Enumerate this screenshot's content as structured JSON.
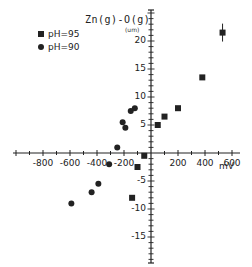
{
  "page": {
    "top_fragment": "on the left and on the decreased"
  },
  "chart_data": {
    "type": "scatter",
    "title": "Zn(g)-O(g)",
    "xlabel": "mV",
    "ylabel": "(um)",
    "xlim": [
      -1000,
      650
    ],
    "ylim": [
      -20,
      23
    ],
    "x_ticks": [
      -800,
      -600,
      -400,
      -200,
      200,
      400,
      600
    ],
    "y_ticks": [
      -15,
      -10,
      -5,
      5,
      10,
      15,
      20
    ],
    "grid": false,
    "legend_position": "upper-left",
    "series": [
      {
        "name": "pH=9.5",
        "label": "pH=95",
        "marker": "square",
        "points": [
          {
            "x": -140,
            "y": -8
          },
          {
            "x": -100,
            "y": -2.5
          },
          {
            "x": -50,
            "y": -0.5
          },
          {
            "x": 50,
            "y": 5
          },
          {
            "x": 100,
            "y": 6.5
          },
          {
            "x": 200,
            "y": 8
          },
          {
            "x": 380,
            "y": 13.5
          },
          {
            "x": 530,
            "y": 21.5,
            "error": 1.6
          }
        ]
      },
      {
        "name": "pH=9.0",
        "label": "pH=90",
        "marker": "circle",
        "points": [
          {
            "x": -590,
            "y": -9
          },
          {
            "x": -440,
            "y": -7
          },
          {
            "x": -390,
            "y": -5.5
          },
          {
            "x": -310,
            "y": -2
          },
          {
            "x": -250,
            "y": 1
          },
          {
            "x": -190,
            "y": 4.5
          },
          {
            "x": -210,
            "y": 5.5
          },
          {
            "x": -150,
            "y": 7.5
          },
          {
            "x": -120,
            "y": 8
          }
        ]
      }
    ]
  }
}
